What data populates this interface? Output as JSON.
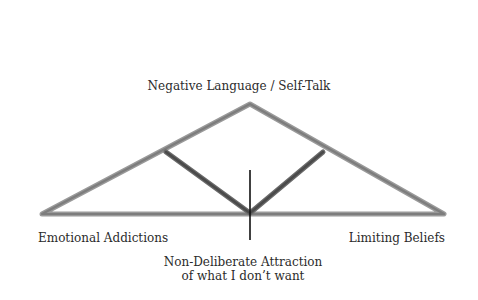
{
  "diagram": {
    "type": "triangle-truss",
    "labels": {
      "apex": "Negative Language / Self-Talk",
      "bottom_left": "Emotional Addictions",
      "bottom_right": "Limiting Beliefs",
      "center_bottom_line1": "Non-Deliberate Attraction",
      "center_bottom_line2": "of what I don’t want"
    },
    "colors": {
      "outer_triangle": "#8e8e8e",
      "inner_v": "#555555",
      "center_line": "#111111",
      "text": "#2b2b2b",
      "background": "#ffffff"
    },
    "geometry": {
      "apex": [
        250,
        104
      ],
      "left_corner": [
        42,
        214
      ],
      "right_corner": [
        444,
        214
      ],
      "inner_left_joint": [
        166,
        152
      ],
      "inner_right_joint": [
        323,
        152
      ],
      "inner_bottom": [
        250,
        213
      ],
      "center_line_top": [
        250,
        170
      ],
      "center_line_bottom": [
        250,
        240
      ]
    }
  }
}
